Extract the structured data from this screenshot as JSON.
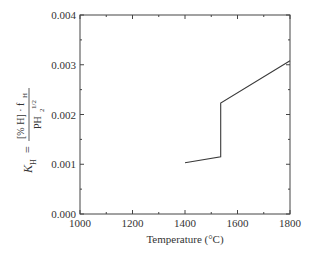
{
  "chart_data": {
    "type": "line",
    "title": "",
    "xlabel": "Temperature (°C)",
    "ylabel": "K_H = [% H] · f_H / PH2^(1/2)",
    "ylabel_parts": {
      "lhs": "K",
      "lhs_sub": "H",
      "equals": "=",
      "numerator": "[% H] · f",
      "numerator_sub": "H",
      "denominator": "PH",
      "denominator_sub": "2",
      "denominator_sup": "1/2"
    },
    "xlim": [
      1000,
      1800
    ],
    "ylim": [
      0.0,
      0.004
    ],
    "x_ticks": [
      1000,
      1200,
      1400,
      1600,
      1800
    ],
    "x_tick_labels": [
      "1000",
      "1200",
      "1400",
      "1600",
      "1800"
    ],
    "x_minor_ticks": [
      1100,
      1300,
      1500,
      1700
    ],
    "y_ticks": [
      0.0,
      0.001,
      0.002,
      0.003,
      0.004
    ],
    "y_tick_labels": [
      "0.000",
      "0.001",
      "0.002",
      "0.003",
      "0.004"
    ],
    "y_minor_ticks": [
      0.0005,
      0.0015,
      0.0025,
      0.0035
    ],
    "grid": false,
    "legend": null,
    "series": [
      {
        "name": "K_H",
        "color": "#3a3a3a",
        "points": [
          {
            "x": 1400,
            "y": 0.00103
          },
          {
            "x": 1536,
            "y": 0.00115
          },
          {
            "x": 1536,
            "y": 0.00223
          },
          {
            "x": 1800,
            "y": 0.00308
          }
        ]
      }
    ]
  }
}
